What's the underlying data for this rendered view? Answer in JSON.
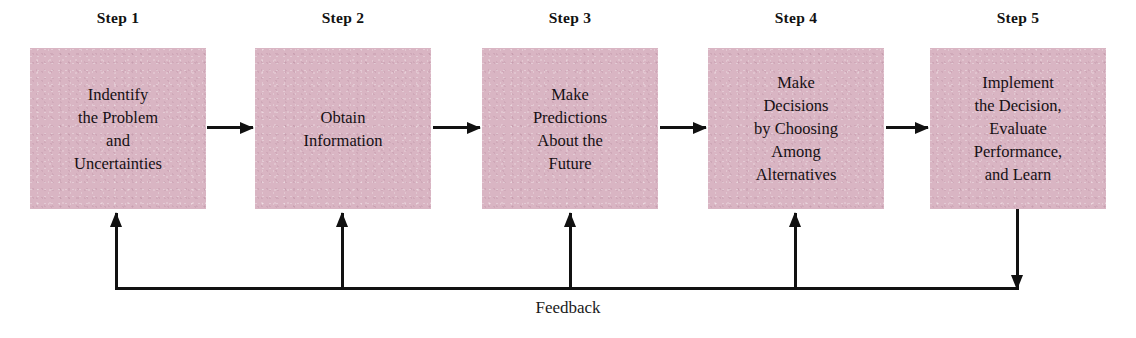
{
  "diagram": {
    "background_color": "#ffffff",
    "box_fill_color": "#d9b5c3",
    "line_color": "#111111",
    "steps": [
      {
        "label": "Step 1",
        "lines": [
          "Indentify",
          "the Problem",
          "and",
          "Uncertainties"
        ],
        "text": "Indentify the Problem and Uncertainties"
      },
      {
        "label": "Step 2",
        "lines": [
          "Obtain",
          "Information"
        ],
        "text": "Obtain Information"
      },
      {
        "label": "Step 3",
        "lines": [
          "Make",
          "Predictions",
          "About the",
          "Future"
        ],
        "text": "Make Predictions About the Future"
      },
      {
        "label": "Step 4",
        "lines": [
          "Make",
          "Decisions",
          "by Choosing",
          "Among",
          "Alternatives"
        ],
        "text": "Make Decisions by Choosing Among Alternatives"
      },
      {
        "label": "Step 5",
        "lines": [
          "Implement",
          "the Decision,",
          "Evaluate",
          "Performance,",
          "and Learn"
        ],
        "text": "Implement the Decision, Evaluate Performance, and Learn"
      }
    ],
    "feedback": {
      "caption": "Feedback",
      "source_step": "Step 5",
      "target_steps": [
        "Step 1",
        "Step 2",
        "Step 3",
        "Step 4"
      ]
    },
    "flow_arrows": [
      {
        "from": "Step 1",
        "to": "Step 2",
        "direction": "right"
      },
      {
        "from": "Step 2",
        "to": "Step 3",
        "direction": "right"
      },
      {
        "from": "Step 3",
        "to": "Step 4",
        "direction": "right"
      },
      {
        "from": "Step 4",
        "to": "Step 5",
        "direction": "right"
      }
    ]
  }
}
